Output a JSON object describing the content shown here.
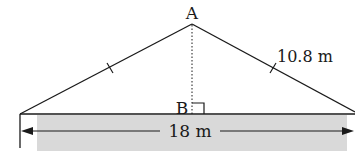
{
  "diagram": {
    "apex_label": "A",
    "foot_label": "B",
    "side_length_label": "10.8 m",
    "base_length_label": "18 m",
    "colors": {
      "line": "#1a1a1a",
      "ground_fill": "#d9d9d9",
      "background": "#ffffff"
    },
    "marks": {
      "equal_side_ticks": 2,
      "right_angle_at": "B",
      "height_line_style": "dotted"
    }
  }
}
